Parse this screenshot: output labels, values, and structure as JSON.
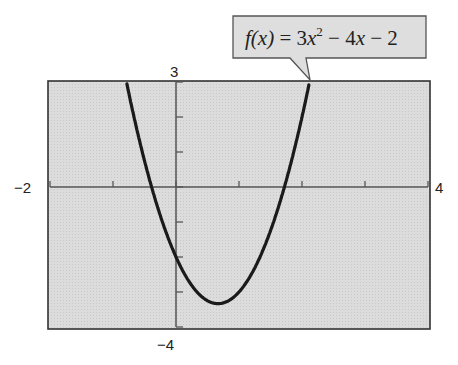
{
  "chart_data": {
    "type": "line",
    "title": "",
    "function_label": "f(x) = 3x² − 4x − 2",
    "function": {
      "a": 3,
      "b": -4,
      "c": -2
    },
    "xlabel": "",
    "ylabel": "",
    "xlim": [
      -2,
      4
    ],
    "ylim": [
      -4,
      3
    ],
    "x_tick_step": 1,
    "y_tick_step": 1,
    "tick_labels": {
      "xmin": "−2",
      "xmax": "4",
      "ymax": "3",
      "ymin": "−4"
    },
    "grid": false,
    "legend": "none",
    "series": [
      {
        "name": "f(x) = 3x^2 - 4x - 2",
        "x": [
          -1.14,
          -1,
          -0.5,
          0,
          0.5,
          0.667,
          1,
          1.5,
          2,
          2.47
        ],
        "y": [
          3.0,
          5.0,
          0.75,
          -2.0,
          -3.25,
          -3.33,
          -3.0,
          -1.25,
          2.0,
          3.0
        ]
      }
    ],
    "colors": {
      "background": "#d9d9d9",
      "curve": "#1a1a1a",
      "axes": "#555555",
      "frame": "#333333"
    }
  },
  "labels": {
    "xmin": "−2",
    "xmax": "4",
    "ymax": "3",
    "ymin": "−4"
  },
  "callout": {
    "f": "f",
    "x_paren": "(x)",
    "eq": " = 3",
    "x2": "x",
    "sup": "2",
    "rest1": " − 4",
    "x3": "x",
    "rest2": " − 2"
  }
}
